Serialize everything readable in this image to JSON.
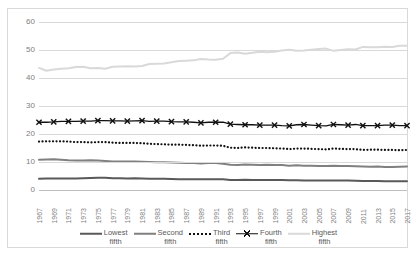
{
  "chart_data": {
    "type": "line",
    "title": "",
    "xlabel": "",
    "ylabel": "",
    "ylim": [
      0,
      60
    ],
    "yticks": [
      0,
      10,
      20,
      30,
      40,
      50,
      60
    ],
    "grid": true,
    "legend_position": "bottom",
    "x": [
      1967,
      1968,
      1969,
      1970,
      1971,
      1972,
      1973,
      1974,
      1975,
      1976,
      1977,
      1978,
      1979,
      1980,
      1981,
      1982,
      1983,
      1984,
      1985,
      1986,
      1987,
      1988,
      1989,
      1990,
      1991,
      1992,
      1993,
      1994,
      1995,
      1996,
      1997,
      1998,
      1999,
      2000,
      2001,
      2002,
      2003,
      2004,
      2005,
      2006,
      2007,
      2008,
      2009,
      2010,
      2011,
      2012,
      2013,
      2014,
      2015,
      2016,
      2017
    ],
    "xticks": [
      "1967",
      "1969",
      "1971",
      "1973",
      "1975",
      "1977",
      "1979",
      "1981",
      "1983",
      "1985",
      "1987",
      "1989",
      "1991",
      "1993",
      "1995",
      "1997",
      "1999",
      "2001",
      "2003",
      "2005",
      "2007",
      "2009",
      "2011",
      "2013",
      "2015",
      "2017"
    ],
    "series": [
      {
        "name": "Lowest fifth",
        "style": "solid",
        "color": "#595959",
        "width": 2.0,
        "marker": "none",
        "values": [
          4.0,
          4.1,
          4.1,
          4.1,
          4.1,
          4.1,
          4.2,
          4.3,
          4.4,
          4.4,
          4.2,
          4.2,
          4.1,
          4.2,
          4.1,
          4.0,
          4.0,
          4.0,
          3.9,
          3.8,
          3.8,
          3.8,
          3.8,
          3.8,
          3.8,
          3.8,
          3.6,
          3.6,
          3.7,
          3.6,
          3.6,
          3.6,
          3.6,
          3.6,
          3.5,
          3.5,
          3.4,
          3.4,
          3.4,
          3.4,
          3.4,
          3.4,
          3.4,
          3.3,
          3.2,
          3.2,
          3.2,
          3.1,
          3.1,
          3.1,
          3.1
        ]
      },
      {
        "name": "Second fifth",
        "style": "solid",
        "color": "#808080",
        "width": 2.0,
        "marker": "none",
        "values": [
          10.8,
          10.9,
          11.0,
          10.8,
          10.6,
          10.5,
          10.5,
          10.6,
          10.5,
          10.4,
          10.2,
          10.2,
          10.2,
          10.2,
          10.1,
          10.0,
          9.9,
          9.9,
          9.8,
          9.7,
          9.6,
          9.6,
          9.5,
          9.6,
          9.6,
          9.4,
          9.0,
          8.9,
          9.1,
          9.0,
          8.9,
          9.0,
          8.9,
          8.9,
          8.7,
          8.8,
          8.7,
          8.7,
          8.6,
          8.6,
          8.7,
          8.6,
          8.6,
          8.5,
          8.4,
          8.3,
          8.4,
          8.2,
          8.2,
          8.3,
          8.4
        ]
      },
      {
        "name": "Third fifth",
        "style": "dotted",
        "color": "#111111",
        "width": 2.2,
        "marker": "none",
        "values": [
          17.3,
          17.4,
          17.4,
          17.4,
          17.3,
          17.1,
          17.1,
          17.0,
          17.1,
          17.1,
          16.9,
          16.8,
          16.8,
          16.8,
          16.7,
          16.5,
          16.4,
          16.3,
          16.2,
          16.2,
          16.1,
          16.0,
          15.8,
          15.9,
          15.9,
          15.8,
          15.1,
          15.0,
          15.2,
          15.1,
          15.0,
          15.0,
          14.9,
          14.8,
          14.6,
          14.8,
          14.8,
          14.7,
          14.6,
          14.5,
          14.8,
          14.7,
          14.6,
          14.6,
          14.3,
          14.4,
          14.4,
          14.3,
          14.3,
          14.2,
          14.3
        ]
      },
      {
        "name": "Fourth fifth",
        "style": "solid",
        "color": "#111111",
        "width": 1.3,
        "marker": "x",
        "values": [
          24.2,
          24.2,
          24.3,
          24.5,
          24.5,
          24.5,
          24.6,
          24.6,
          24.8,
          24.8,
          24.7,
          24.7,
          24.6,
          24.7,
          24.8,
          24.5,
          24.6,
          24.6,
          24.4,
          24.3,
          24.3,
          24.2,
          24.0,
          24.2,
          24.2,
          24.2,
          23.5,
          23.4,
          23.3,
          23.3,
          23.2,
          23.2,
          23.2,
          23.0,
          22.9,
          23.3,
          23.4,
          23.2,
          23.0,
          22.9,
          23.4,
          23.3,
          23.2,
          23.4,
          23.0,
          23.0,
          23.0,
          23.2,
          23.2,
          23.0,
          23.0
        ]
      },
      {
        "name": "Highest fifth",
        "style": "solid",
        "color": "#d9d9d9",
        "width": 2.0,
        "marker": "none",
        "values": [
          43.6,
          42.6,
          43.0,
          43.3,
          43.5,
          43.9,
          44.0,
          43.5,
          43.6,
          43.3,
          44.0,
          44.1,
          44.2,
          44.1,
          44.3,
          45.0,
          45.1,
          45.2,
          45.6,
          46.1,
          46.2,
          46.3,
          46.8,
          46.6,
          46.5,
          46.9,
          48.9,
          49.1,
          48.7,
          49.0,
          49.4,
          49.2,
          49.4,
          49.8,
          50.1,
          49.7,
          49.8,
          50.1,
          50.4,
          50.5,
          49.7,
          50.0,
          50.3,
          50.2,
          51.1,
          51.0,
          51.0,
          51.2,
          51.1,
          51.5,
          51.5
        ]
      }
    ]
  },
  "legend": {
    "items": [
      {
        "label_line1": "Lowest",
        "label_line2": "fifth"
      },
      {
        "label_line1": "Second",
        "label_line2": "fifth"
      },
      {
        "label_line1": "Third",
        "label_line2": "fifth"
      },
      {
        "label_line1": "Fourth",
        "label_line2": "fifth"
      },
      {
        "label_line1": "Highest",
        "label_line2": "fifth"
      }
    ]
  }
}
